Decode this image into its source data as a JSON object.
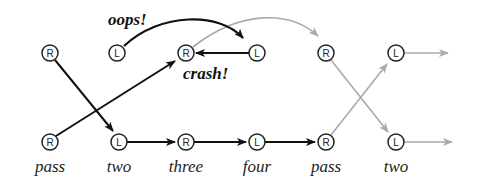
{
  "colors": {
    "dark": "#111111",
    "light": "#aaaaaa",
    "node_stroke": "#222222"
  },
  "top_row": [
    {
      "letter": "R",
      "x": 50
    },
    {
      "letter": "L",
      "x": 117
    },
    {
      "letter": "R",
      "x": 186
    },
    {
      "letter": "L",
      "x": 257
    },
    {
      "letter": "R",
      "x": 326
    },
    {
      "letter": "L",
      "x": 396
    }
  ],
  "bottom_row": [
    {
      "letter": "R",
      "x": 50,
      "word": "pass"
    },
    {
      "letter": "L",
      "x": 119,
      "word": "two"
    },
    {
      "letter": "R",
      "x": 186,
      "word": "three"
    },
    {
      "letter": "L",
      "x": 257,
      "word": "four"
    },
    {
      "letter": "R",
      "x": 326,
      "word": "pass"
    },
    {
      "letter": "L",
      "x": 396,
      "word": "two"
    }
  ],
  "annotations": {
    "oops": "oops!",
    "crash": "crash!"
  }
}
